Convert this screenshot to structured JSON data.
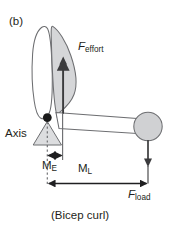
{
  "figure": {
    "panel_letter": "(b)",
    "caption": "(Bicep curl)",
    "axis_label": "Axis",
    "force_effort": {
      "symbol": "F",
      "subscript": "effort"
    },
    "force_load": {
      "symbol": "F",
      "subscript": "load"
    },
    "moment_effort": {
      "symbol": "M",
      "subscript": "E"
    },
    "moment_load": {
      "symbol": "M",
      "subscript": "L"
    },
    "header_ghost": " ",
    "colors": {
      "stroke": "#58595b",
      "text": "#231f20",
      "muscle_fill": "#d5d6d8",
      "ball_fill": "#d0d1d3",
      "fulcrum_fill": "#dcdddf",
      "arrow": "#3b3b3d",
      "background": "#ffffff",
      "joint": "#1a1a1a"
    }
  }
}
